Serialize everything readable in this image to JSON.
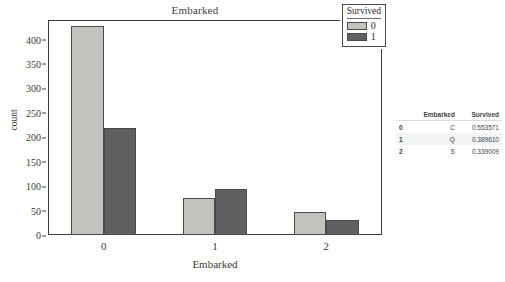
{
  "chart_data": {
    "type": "bar",
    "title": "Embarked",
    "xlabel": "Embarked",
    "ylabel": "count",
    "categories": [
      "0",
      "1",
      "2"
    ],
    "series": [
      {
        "name": "0",
        "values": [
          427,
          75,
          48
        ],
        "color": "#c3c3bd"
      },
      {
        "name": "1",
        "values": [
          220,
          95,
          30
        ],
        "color": "#606060"
      }
    ],
    "legend_title": "Survived",
    "legend_position": "top-right",
    "ylim": [
      0,
      440
    ],
    "yticks": [
      0,
      50,
      100,
      150,
      200,
      250,
      300,
      350,
      400
    ],
    "grid": false
  },
  "table": {
    "columns": [
      "",
      "Embarked",
      "Survived"
    ],
    "rows": [
      {
        "index": "0",
        "embarked": "C",
        "survived": "0.553571"
      },
      {
        "index": "1",
        "embarked": "Q",
        "survived": "0.389610"
      },
      {
        "index": "2",
        "embarked": "S",
        "survived": "0.339009"
      }
    ]
  }
}
